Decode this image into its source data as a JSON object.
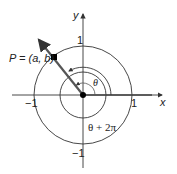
{
  "diagram": {
    "type": "unit-circle-angle",
    "axes": {
      "x_label": "x",
      "y_label": "y"
    },
    "ticks": {
      "pos_x": "1",
      "neg_x": "−1",
      "pos_y": "1",
      "neg_y": "−1"
    },
    "point_label": "P = (a, b)",
    "angle_label": "θ",
    "angle_label_full": "θ + 2π",
    "colors": {
      "line": "#333333",
      "ray": "#555555",
      "point": "#000000"
    }
  }
}
